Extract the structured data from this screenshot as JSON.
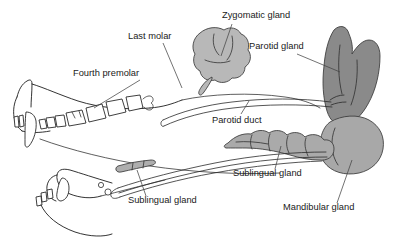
{
  "figure": {
    "background_color": "#ffffff",
    "labels": [
      {
        "id": "zygomatic",
        "text": "Zygomatic gland",
        "x": 222,
        "y": 18
      },
      {
        "id": "parotid",
        "text": "Parotid gland",
        "x": 249,
        "y": 49
      },
      {
        "id": "last-molar",
        "text": "Last molar",
        "x": 128,
        "y": 39
      },
      {
        "id": "fourth-premolar",
        "text": "Fourth premolar",
        "x": 73,
        "y": 76
      },
      {
        "id": "parotid-duct",
        "text": "Parotid duct",
        "x": 212,
        "y": 123
      },
      {
        "id": "sublingual-upper",
        "text": "Sublingual gland",
        "x": 233,
        "y": 176
      },
      {
        "id": "sublingual-lower",
        "text": "Sublingual gland",
        "x": 128,
        "y": 203
      },
      {
        "id": "mandibular",
        "text": "Mandibular gland",
        "x": 283,
        "y": 210
      }
    ],
    "structures": [
      {
        "id": "zygomatic-gland",
        "name": "Zygomatic gland",
        "fill": "#b8b8b8",
        "shape": "lobed-blob"
      },
      {
        "id": "parotid-gland",
        "name": "Parotid gland",
        "fill": "#8a8a8a",
        "shape": "notched-kidney"
      },
      {
        "id": "mandibular-gland",
        "name": "Mandibular gland",
        "fill": "#a8a8a8",
        "shape": "oval"
      },
      {
        "id": "sublingual-gland-polystomatic",
        "name": "Sublingual gland",
        "fill": "#aaaaaa",
        "shape": "lobulated-chain"
      },
      {
        "id": "sublingual-gland-monostomatic",
        "name": "Sublingual gland",
        "fill": "#aeaeae",
        "shape": "small-elongated"
      },
      {
        "id": "skull",
        "name": "Skull outline",
        "fill": "none"
      },
      {
        "id": "mandible",
        "name": "Mandible outline",
        "fill": "none"
      },
      {
        "id": "teeth",
        "name": "Tooth row",
        "fill": "#ffffff"
      },
      {
        "id": "parotid-duct-line",
        "name": "Parotid duct",
        "fill": "none"
      },
      {
        "id": "mandibular-duct-line",
        "name": "Mandibular and sublingual ducts",
        "fill": "none"
      }
    ],
    "colors": {
      "line": "#1d1d1d",
      "text": "#1a1a1a",
      "leader": "#444444",
      "zygomatic_fill": "#b8b8b8",
      "parotid_fill": "#8a8a8a",
      "mandibular_fill": "#a8a8a8",
      "sublingual_fill": "#aaaaaa"
    }
  }
}
